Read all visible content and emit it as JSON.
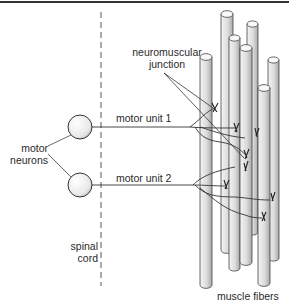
{
  "diagram": {
    "title_rule": true,
    "labels": {
      "neuromuscular_junction": [
        "neuromuscular",
        "junction"
      ],
      "motor_unit_1": "motor unit 1",
      "motor_unit_2": "motor unit 2",
      "motor_neurons": [
        "motor",
        "neurons"
      ],
      "spinal_cord": [
        "spinal",
        "cord"
      ],
      "muscle_fibers": "muscle fibers"
    },
    "colors": {
      "line": "#333333",
      "fiber_fill": "#e6e6e6",
      "fiber_shade": "#9a9a9a",
      "neuron_fill": "#f2f2f2"
    },
    "neurons": [
      {
        "id": "neuron-1",
        "cx": 80,
        "cy": 127,
        "r": 12
      },
      {
        "id": "neuron-2",
        "cx": 80,
        "cy": 185,
        "r": 12
      }
    ],
    "fibers": [
      {
        "x": 221,
        "w": 12,
        "top": 14,
        "bottom": 250
      },
      {
        "x": 247,
        "w": 11,
        "top": 24,
        "bottom": 232
      },
      {
        "x": 229,
        "w": 11,
        "top": 38,
        "bottom": 268
      },
      {
        "x": 240,
        "w": 12,
        "top": 48,
        "bottom": 262
      },
      {
        "x": 268,
        "w": 11,
        "top": 60,
        "bottom": 258
      },
      {
        "x": 200,
        "w": 12,
        "top": 57,
        "bottom": 285
      },
      {
        "x": 258,
        "w": 12,
        "top": 88,
        "bottom": 283
      }
    ]
  }
}
